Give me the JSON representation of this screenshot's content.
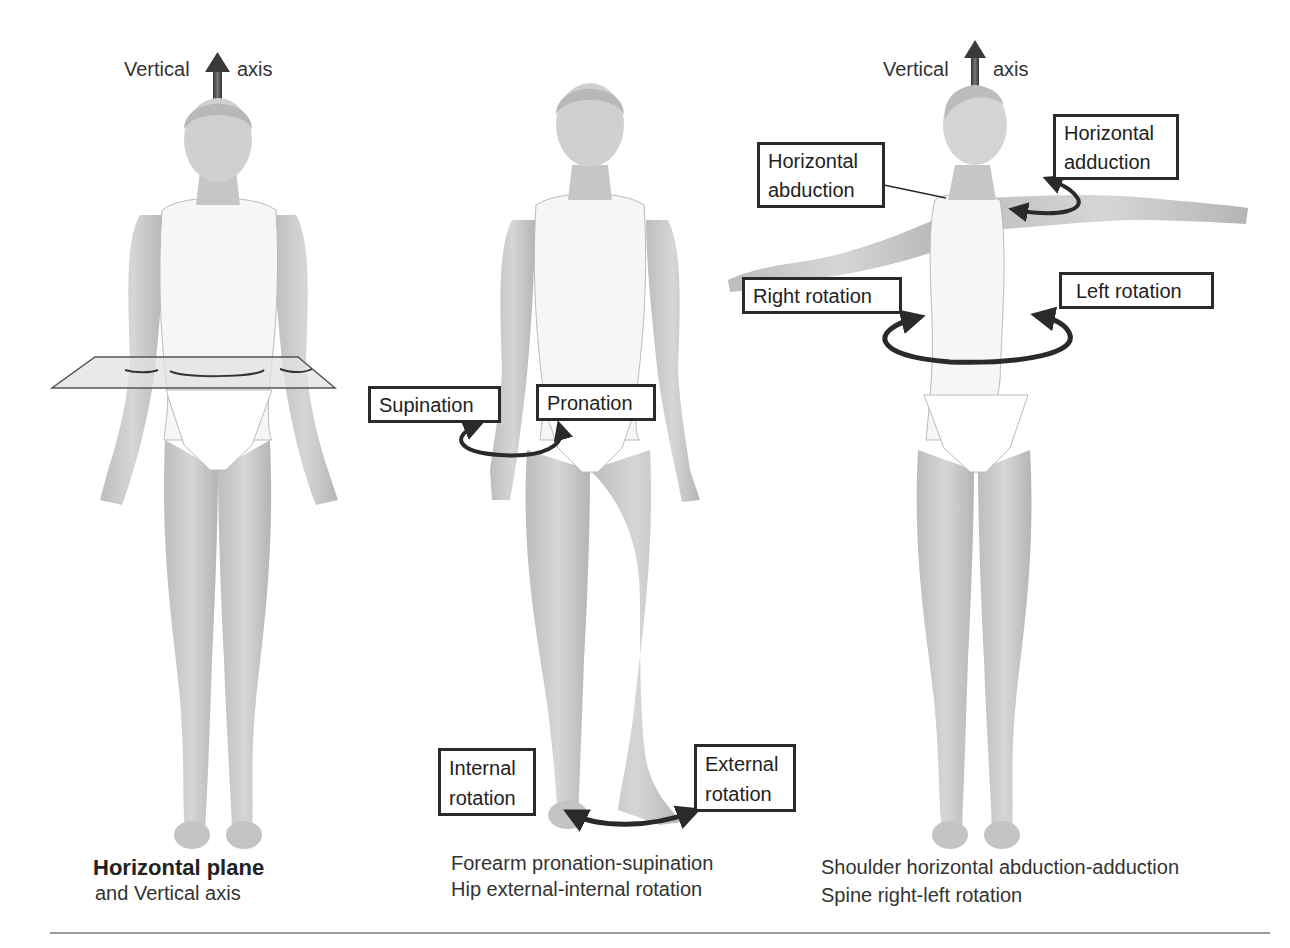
{
  "figures": [
    {
      "id": "horizontal-plane-figure",
      "axis_label_left": "Vertical",
      "axis_label_right": "axis",
      "caption_title": "Horizontal plane",
      "caption_sub": "and Vertical axis"
    },
    {
      "id": "pronation-rotation-figure",
      "labels": {
        "supination": "Supination",
        "pronation": "Pronation",
        "internal_rotation_line1": "Internal",
        "internal_rotation_line2": "rotation",
        "external_rotation_line1": "External",
        "external_rotation_line2": "rotation"
      },
      "caption_line1": "Forearm pronation-supination",
      "caption_line2": "Hip external-internal rotation"
    },
    {
      "id": "shoulder-spine-figure",
      "axis_label_left": "Vertical",
      "axis_label_right": "axis",
      "labels": {
        "horizontal_abduction_line1": "Horizontal",
        "horizontal_abduction_line2": "abduction",
        "horizontal_adduction_line1": "Horizontal",
        "horizontal_adduction_line2": "adduction",
        "right_rotation": "Right rotation",
        "left_rotation": "Left rotation"
      },
      "caption_line1": "Shoulder horizontal abduction-adduction",
      "caption_line2": "Spine right-left rotation"
    }
  ],
  "colors": {
    "skin": "#c8c8c8",
    "skin_dark": "#a8a8a8",
    "garment": "#ffffff",
    "arrow": "#2a2a2a",
    "plane": "#e2e2e2",
    "box_border": "#2a2a2a"
  }
}
